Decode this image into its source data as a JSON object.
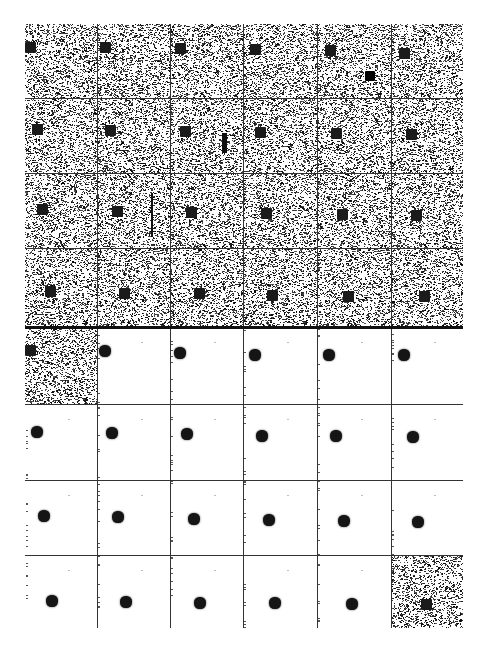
{
  "figure": {
    "title": "",
    "grid": {
      "columns": 6,
      "rows": 8,
      "section_split_after_row": 4
    },
    "col_edges_px": [
      25,
      97,
      170,
      243,
      317,
      391,
      463
    ],
    "row_edges_px": [
      24,
      98,
      173,
      248,
      327,
      404,
      480,
      555,
      628
    ],
    "colors": {
      "noise": "#1a1a1a",
      "background": "#ffffff",
      "grid_line": "#333333",
      "object": "#151515"
    },
    "upper_section": {
      "label": "noisy observations",
      "frames": [
        {
          "r": 0,
          "c": 0,
          "obj": [
            0,
            18
          ]
        },
        {
          "r": 0,
          "c": 1,
          "obj": [
            3,
            18
          ]
        },
        {
          "r": 0,
          "c": 2,
          "obj": [
            5,
            19
          ]
        },
        {
          "r": 0,
          "c": 3,
          "obj": [
            7,
            20
          ]
        },
        {
          "r": 0,
          "c": 4,
          "obj": [
            8,
            21
          ],
          "extra_sq": [
            48,
            47
          ]
        },
        {
          "r": 0,
          "c": 5,
          "obj": [
            8,
            24
          ]
        },
        {
          "r": 1,
          "c": 0,
          "obj": [
            7,
            26
          ]
        },
        {
          "r": 1,
          "c": 1,
          "obj": [
            8,
            27
          ]
        },
        {
          "r": 1,
          "c": 2,
          "obj": [
            10,
            28
          ],
          "extra_bar": [
            52,
            35,
            5,
            20
          ]
        },
        {
          "r": 1,
          "c": 3,
          "obj": [
            12,
            29
          ]
        },
        {
          "r": 1,
          "c": 4,
          "obj": [
            14,
            30
          ]
        },
        {
          "r": 1,
          "c": 5,
          "obj": [
            15,
            31
          ]
        },
        {
          "r": 2,
          "c": 0,
          "obj": [
            12,
            31
          ]
        },
        {
          "r": 2,
          "c": 1,
          "obj": [
            15,
            33
          ],
          "extra_bar": [
            54,
            20,
            2,
            44
          ]
        },
        {
          "r": 2,
          "c": 2,
          "obj": [
            16,
            34
          ]
        },
        {
          "r": 2,
          "c": 3,
          "obj": [
            18,
            35
          ]
        },
        {
          "r": 2,
          "c": 4,
          "obj": [
            20,
            36
          ]
        },
        {
          "r": 2,
          "c": 5,
          "obj": [
            20,
            37
          ]
        },
        {
          "r": 3,
          "c": 0,
          "obj": [
            20,
            38
          ]
        },
        {
          "r": 3,
          "c": 1,
          "obj": [
            22,
            40
          ]
        },
        {
          "r": 3,
          "c": 2,
          "obj": [
            24,
            40
          ]
        },
        {
          "r": 3,
          "c": 3,
          "obj": [
            24,
            42
          ]
        },
        {
          "r": 3,
          "c": 4,
          "obj": [
            26,
            43
          ]
        },
        {
          "r": 3,
          "c": 5,
          "obj": [
            28,
            43
          ]
        }
      ]
    },
    "lower_section": {
      "label": "filtered estimates",
      "frames": [
        {
          "r": 4,
          "c": 0,
          "obj": [
            0,
            18
          ],
          "noisy": true
        },
        {
          "r": 4,
          "c": 1,
          "obj": [
            2,
            18
          ]
        },
        {
          "r": 4,
          "c": 2,
          "obj": [
            4,
            20
          ]
        },
        {
          "r": 4,
          "c": 3,
          "obj": [
            6,
            22
          ]
        },
        {
          "r": 4,
          "c": 4,
          "obj": [
            6,
            22
          ]
        },
        {
          "r": 4,
          "c": 5,
          "obj": [
            7,
            22
          ]
        },
        {
          "r": 5,
          "c": 0,
          "obj": [
            6,
            22
          ]
        },
        {
          "r": 5,
          "c": 1,
          "obj": [
            9,
            23
          ]
        },
        {
          "r": 5,
          "c": 2,
          "obj": [
            11,
            24
          ]
        },
        {
          "r": 5,
          "c": 3,
          "obj": [
            13,
            26
          ]
        },
        {
          "r": 5,
          "c": 4,
          "obj": [
            13,
            26
          ]
        },
        {
          "r": 5,
          "c": 5,
          "obj": [
            16,
            27
          ]
        },
        {
          "r": 6,
          "c": 0,
          "obj": [
            13,
            30
          ]
        },
        {
          "r": 6,
          "c": 1,
          "obj": [
            15,
            31
          ]
        },
        {
          "r": 6,
          "c": 2,
          "obj": [
            18,
            33
          ]
        },
        {
          "r": 6,
          "c": 3,
          "obj": [
            20,
            34
          ]
        },
        {
          "r": 6,
          "c": 4,
          "obj": [
            21,
            35
          ]
        },
        {
          "r": 6,
          "c": 5,
          "obj": [
            21,
            36
          ]
        },
        {
          "r": 7,
          "c": 0,
          "obj": [
            21,
            40
          ]
        },
        {
          "r": 7,
          "c": 1,
          "obj": [
            23,
            41
          ]
        },
        {
          "r": 7,
          "c": 2,
          "obj": [
            24,
            42
          ]
        },
        {
          "r": 7,
          "c": 3,
          "obj": [
            26,
            42
          ]
        },
        {
          "r": 7,
          "c": 4,
          "obj": [
            29,
            43
          ]
        },
        {
          "r": 7,
          "c": 5,
          "obj": [
            30,
            44
          ],
          "noisy": true
        }
      ]
    }
  }
}
